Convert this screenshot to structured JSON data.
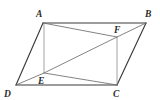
{
  "figure": {
    "canvas": {
      "width": 160,
      "height": 100,
      "background": "#ffffff"
    },
    "colors": {
      "outline": "#3a3a3a",
      "chord": "#6d6d6d",
      "vertical": "#8a8a8a",
      "label": "#2b2b2b"
    },
    "points": [
      {
        "id": "A",
        "label": "A",
        "x": 43,
        "y": 23,
        "label_x": 36,
        "label_y": 17
      },
      {
        "id": "B",
        "label": "B",
        "x": 146,
        "y": 23,
        "label_x": 145,
        "label_y": 17
      },
      {
        "id": "C",
        "label": "C",
        "x": 117,
        "y": 85,
        "label_x": 113,
        "label_y": 97
      },
      {
        "id": "D",
        "label": "D",
        "x": 16,
        "y": 85,
        "label_x": 4,
        "label_y": 97
      },
      {
        "id": "E",
        "label": "E",
        "x": 44,
        "y": 73,
        "label_x": 38,
        "label_y": 84
      },
      {
        "id": "F",
        "label": "F",
        "x": 117,
        "y": 37,
        "label_x": 114,
        "label_y": 33
      }
    ],
    "outline_path": "M 43 23 L 146 23 L 117 85 L 16 85 Z",
    "segments": [
      {
        "name": "segment-AB",
        "from": "A",
        "to": "B",
        "kind": "edge",
        "d": "M 43 23 L 146 23"
      },
      {
        "name": "segment-BC",
        "from": "B",
        "to": "C",
        "kind": "edge",
        "d": "M 146 23 L 117 85"
      },
      {
        "name": "segment-CD",
        "from": "C",
        "to": "D",
        "kind": "edge",
        "d": "M 117 85 L 16 85"
      },
      {
        "name": "segment-DA",
        "from": "D",
        "to": "A",
        "kind": "edge",
        "d": "M 16 85 L 43 23"
      },
      {
        "name": "diagonal-DB",
        "from": "D",
        "to": "B",
        "kind": "chord",
        "d": "M 16 85 L 44 73 L 117 37 L 146 23"
      },
      {
        "name": "segment-AF",
        "from": "A",
        "to": "F",
        "kind": "chord",
        "d": "M 43 23 L 117 37"
      },
      {
        "name": "segment-EC",
        "from": "E",
        "to": "C",
        "kind": "chord",
        "d": "M 44 73 L 117 85"
      },
      {
        "name": "segment-AE",
        "from": "A",
        "to": "E",
        "kind": "vertical",
        "d": "M 44 23 L 44 73"
      },
      {
        "name": "segment-FC",
        "from": "F",
        "to": "C",
        "kind": "vertical",
        "d": "M 117 37 L 117 85"
      }
    ]
  }
}
